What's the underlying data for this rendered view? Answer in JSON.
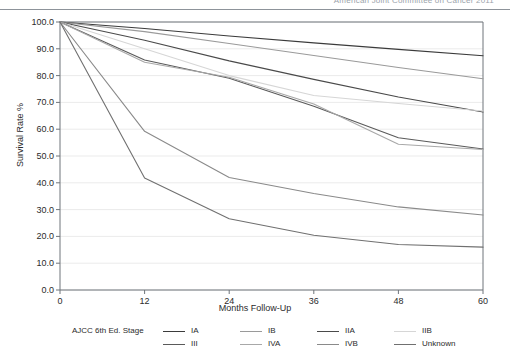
{
  "header": {
    "text": "American Joint Committee on Cancer   2011"
  },
  "chart_data": {
    "type": "line",
    "title": "",
    "xlabel": "Months Follow-Up",
    "ylabel": "Survival Rate %",
    "x": [
      0,
      12,
      24,
      36,
      48,
      60
    ],
    "xlim": [
      0,
      60
    ],
    "ylim": [
      0,
      100
    ],
    "xticks": [
      "0",
      "12",
      "24",
      "36",
      "48",
      "60"
    ],
    "yticks": [
      "0.0",
      "10.0",
      "20.0",
      "30.0",
      "40.0",
      "50.0",
      "60.0",
      "70.0",
      "80.0",
      "90.0",
      "100.0"
    ],
    "grid": true,
    "legend_position": "below",
    "legend_title": "AJCC 6th Ed. Stage",
    "series": [
      {
        "name": "IA",
        "color": "#3b3b3b",
        "values": [
          100.0,
          97.6,
          94.8,
          92.2,
          89.8,
          87.4
        ]
      },
      {
        "name": "IB",
        "color": "#9a9a9a",
        "values": [
          100.0,
          96.4,
          92.0,
          87.5,
          83.0,
          78.8
        ]
      },
      {
        "name": "IIA",
        "color": "#4a4a4a",
        "values": [
          100.0,
          93.2,
          85.5,
          78.6,
          72.0,
          66.4
        ]
      },
      {
        "name": "IIB",
        "color": "#d6d6d6",
        "values": [
          100.0,
          90.0,
          80.0,
          72.6,
          69.6,
          66.8
        ]
      },
      {
        "name": "III",
        "color": "#5a5a5a",
        "values": [
          100.0,
          85.8,
          79.0,
          68.6,
          56.8,
          52.6
        ]
      },
      {
        "name": "IVA",
        "color": "#a8a8a8",
        "values": [
          100.0,
          85.0,
          79.4,
          69.4,
          54.4,
          52.4
        ]
      },
      {
        "name": "IVB",
        "color": "#8a8a8a",
        "values": [
          100.0,
          59.2,
          42.0,
          36.0,
          31.0,
          28.0
        ]
      },
      {
        "name": "Unknown",
        "color": "#707070",
        "values": [
          100.0,
          41.8,
          26.6,
          20.4,
          17.0,
          16.0
        ]
      }
    ]
  },
  "legend": {
    "title": "AJCC 6th Ed. Stage",
    "items": [
      {
        "label": "IA"
      },
      {
        "label": "IB"
      },
      {
        "label": "IIA"
      },
      {
        "label": "IIB"
      },
      {
        "label": "III"
      },
      {
        "label": "IVA"
      },
      {
        "label": "IVB"
      },
      {
        "label": "Unknown"
      }
    ]
  },
  "axes": {
    "y_title": "Survival Rate %",
    "x_title": "Months Follow-Up"
  },
  "colors": {
    "grid": "#ebebeb",
    "axis": "#6f757b",
    "text": "#2b2b2b",
    "header_rule": "#8d939a"
  }
}
